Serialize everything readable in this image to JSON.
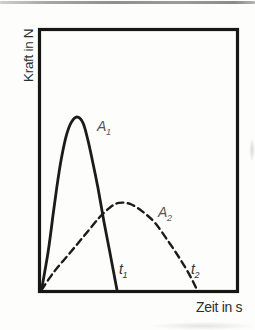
{
  "chart": {
    "ylabel": "Kraft in N",
    "xlabel": "Zeit in s",
    "labels": {
      "a1": {
        "letter": "A",
        "sub": "1"
      },
      "a2": {
        "letter": "A",
        "sub": "2"
      },
      "t1": {
        "letter": "t",
        "sub": "1"
      },
      "t2": {
        "letter": "t",
        "sub": "2"
      }
    }
  },
  "colors": {
    "curve": "#1b1b1b",
    "frame": "#171717",
    "axis_label": "#2d2d2d",
    "curve_label": "#575757",
    "page_edge_line": "#9a9a9a"
  },
  "chart_data": {
    "type": "line",
    "title": "",
    "xlabel": "Zeit in s",
    "ylabel": "Kraft in N",
    "axes": {
      "frame": "closed box",
      "grid": false,
      "x_ticks": [],
      "y_ticks": [],
      "note": "qualitative diagram, no numeric scale; coordinates normalized 0-1 of plot box"
    },
    "legend": "none",
    "series": [
      {
        "name": "A1",
        "label": "A₁",
        "style": "solid",
        "color": "#1b1b1b",
        "peak": [
          0.18,
          0.67
        ],
        "x_end": 0.389,
        "x_end_label": "t₁",
        "points": [
          [
            0.0,
            0.0
          ],
          [
            0.034,
            0.148
          ],
          [
            0.059,
            0.288
          ],
          [
            0.08,
            0.405
          ],
          [
            0.101,
            0.506
          ],
          [
            0.126,
            0.595
          ],
          [
            0.152,
            0.65
          ],
          [
            0.183,
            0.673
          ],
          [
            0.214,
            0.65
          ],
          [
            0.24,
            0.58
          ],
          [
            0.265,
            0.494
          ],
          [
            0.291,
            0.397
          ],
          [
            0.322,
            0.265
          ],
          [
            0.353,
            0.144
          ],
          [
            0.389,
            0.0
          ]
        ]
      },
      {
        "name": "A2",
        "label": "A₂",
        "style": "dashed",
        "color": "#1b1b1b",
        "peak": [
          0.4,
          0.34
        ],
        "x_end": 0.802,
        "x_end_label": "t₂",
        "points": [
          [
            0.0,
            0.0
          ],
          [
            0.064,
            0.07
          ],
          [
            0.142,
            0.14
          ],
          [
            0.219,
            0.21
          ],
          [
            0.296,
            0.28
          ],
          [
            0.353,
            0.321
          ],
          [
            0.399,
            0.339
          ],
          [
            0.456,
            0.335
          ],
          [
            0.518,
            0.307
          ],
          [
            0.585,
            0.261
          ],
          [
            0.652,
            0.191
          ],
          [
            0.714,
            0.121
          ],
          [
            0.765,
            0.056
          ],
          [
            0.802,
            0.0
          ]
        ]
      }
    ],
    "annotations": [
      {
        "text": "A₁",
        "attached_to": "A1"
      },
      {
        "text": "A₂",
        "attached_to": "A2"
      },
      {
        "text": "t₁",
        "x": 0.389,
        "y": 0.0
      },
      {
        "text": "t₂",
        "x": 0.802,
        "y": 0.0
      }
    ]
  }
}
